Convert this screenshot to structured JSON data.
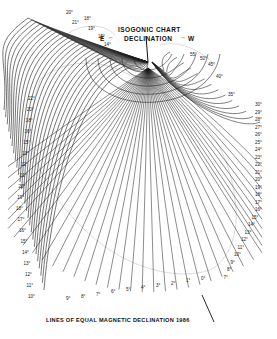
{
  "map": {
    "title": "ISOGONIC CHART",
    "subtitle": "DECLINATION",
    "east_label": "E",
    "west_label": "W",
    "caption": "LINES OF EQUAL MAGNETIC DECLINATION 1986",
    "line_color": "#1a1a1a",
    "background": "#ffffff"
  },
  "labels": {
    "top_left": [
      "20°",
      "21°",
      "18°",
      "19°",
      "15°",
      "14°"
    ],
    "top_right": [
      "55°",
      "50°",
      "45°",
      "40°",
      "35°"
    ],
    "left_side": [
      "22°",
      "20°",
      "18°",
      "16°",
      "15°",
      "13°",
      "12°",
      "21°",
      "20°",
      "19°",
      "18°",
      "17°",
      "16°",
      "15°",
      "14°",
      "13°",
      "12°",
      "11°",
      "10°"
    ],
    "right_side": [
      "30°",
      "29°",
      "28°",
      "27°",
      "26°",
      "25°",
      "24°",
      "23°",
      "22°",
      "21°",
      "20°",
      "19°",
      "18°",
      "17°",
      "16°",
      "15°",
      "14°",
      "13°",
      "12°",
      "11°",
      "10°",
      "9°",
      "8°",
      "7°"
    ],
    "bottom": [
      "9°",
      "8°",
      "7°",
      "6°",
      "5°",
      "4°",
      "3°",
      "2°",
      "1°",
      "0°"
    ]
  }
}
